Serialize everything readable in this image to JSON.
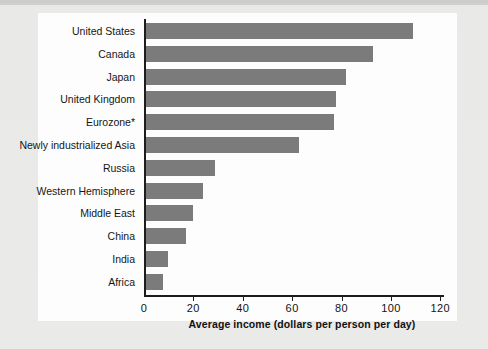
{
  "chart_data": {
    "type": "bar",
    "orientation": "horizontal",
    "title": "",
    "xlabel": "Average income (dollars per person per day)",
    "ylabel": "",
    "xlim": [
      0,
      128
    ],
    "xticks": [
      0,
      20,
      40,
      60,
      80,
      100,
      120
    ],
    "xtick_labels": [
      "0",
      "20",
      "40",
      "60",
      "80",
      "100",
      "120"
    ],
    "grid": false,
    "legend": false,
    "bar_color": "#7b7b7b",
    "categories": [
      "United States",
      "Canada",
      "Japan",
      "United Kingdom",
      "Eurozone*",
      "Newly industrialized Asia",
      "Russia",
      "Western Hemisphere",
      "Middle East",
      "China",
      "India",
      "Africa"
    ],
    "values": [
      108,
      92,
      81,
      77,
      76,
      62,
      28,
      23,
      19,
      16,
      9,
      7
    ]
  },
  "axis": {
    "title": "Average income (dollars per person per day)"
  }
}
